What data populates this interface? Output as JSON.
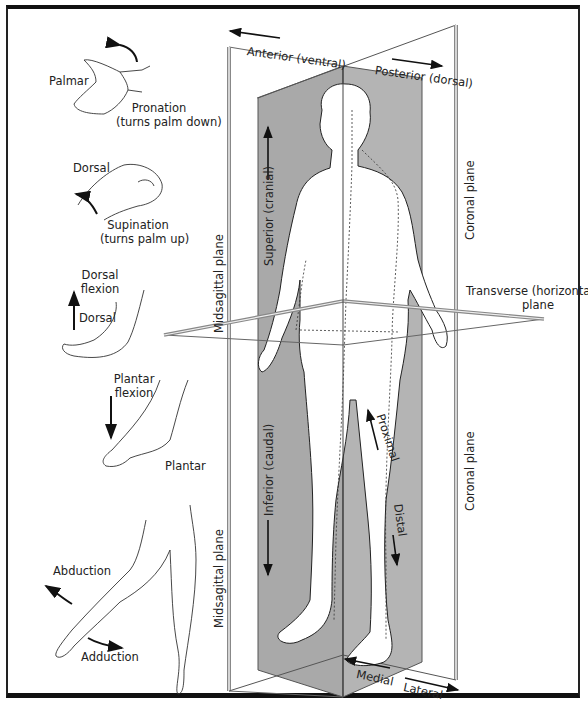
{
  "figure": {
    "type": "anatomical-planes-and-directional-terms",
    "colors": {
      "plane_fill": "#a9a9a9",
      "plane_edge": "#555555",
      "line": "#222222",
      "background": "#ffffff",
      "frame": "#111111"
    }
  },
  "planes": {
    "midsagittal_upper": "Midsagittal plane",
    "midsagittal_lower": "Midsagittal plane",
    "coronal_upper": "Coronal plane",
    "coronal_lower": "Coronal plane",
    "transverse_line1": "Transverse (horizontal)",
    "transverse_line2": "plane"
  },
  "directions": {
    "anterior": "Anterior (ventral)",
    "posterior": "Posterior (dorsal)",
    "superior": "Superior (cranial)",
    "inferior": "Inferior (caudal)",
    "proximal": "Proximal",
    "distal": "Distal",
    "medial": "Medial",
    "lateral": "Lateral"
  },
  "movements": {
    "palmar": "Palmar",
    "pronation_line1": "Pronation",
    "pronation_line2": "(turns palm down)",
    "dorsal_hand": "Dorsal",
    "supination_line1": "Supination",
    "supination_line2": "(turns palm up)",
    "dorsal_flexion_line1": "Dorsal",
    "dorsal_flexion_line2": "flexion",
    "dorsal_foot": "Dorsal",
    "plantar_flexion_line1": "Plantar",
    "plantar_flexion_line2": "flexion",
    "plantar": "Plantar",
    "abduction": "Abduction",
    "adduction": "Adduction"
  }
}
